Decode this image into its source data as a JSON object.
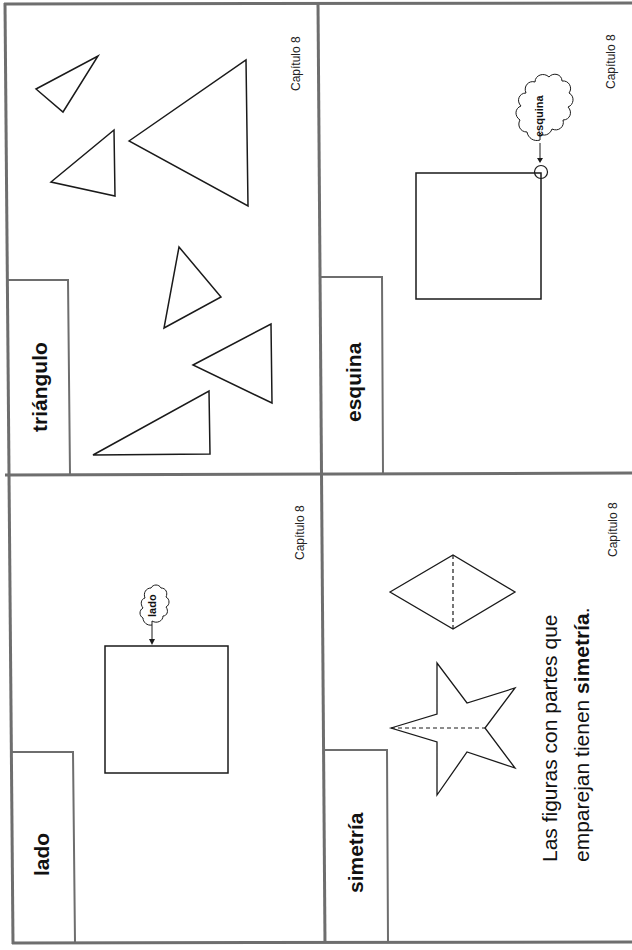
{
  "cards": [
    {
      "id": "triangulo",
      "word": "triángulo",
      "chapter": "Capítulo 8",
      "shapes": [
        "triangle",
        "triangle",
        "triangle",
        "triangle",
        "triangle",
        "triangle"
      ]
    },
    {
      "id": "esquina",
      "word": "esquina",
      "chapter": "Capítulo 8",
      "callout": "esquina",
      "shapes": [
        "square",
        "corner-circle"
      ]
    },
    {
      "id": "lado",
      "word": "lado",
      "chapter": "Capítulo 8",
      "callout": "lado",
      "shapes": [
        "square"
      ]
    },
    {
      "id": "simetria",
      "word": "simetría",
      "chapter": "Capítulo 8",
      "shapes": [
        "rhombus-with-symmetry-line",
        "star-with-symmetry-line"
      ],
      "sentence": {
        "line1": "Las figuras con partes que",
        "line2_prefix": "emparejan tienen ",
        "line2_bold": "simetría",
        "line2_suffix": "."
      }
    }
  ],
  "colors": {
    "border": "#6e6e6e",
    "line": "#1a1a1a",
    "background": "#ffffff"
  }
}
